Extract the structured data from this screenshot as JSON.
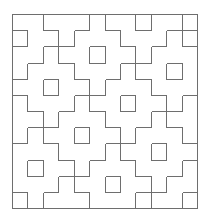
{
  "figure": {
    "grid": {
      "cols": 12,
      "rows": 12
    },
    "frame": {
      "x": 12,
      "y": 14,
      "cell_w": 15.42,
      "cell_h": 16.17
    },
    "tile": {
      "shape": "diamond",
      "radius": 2,
      "cells_per_tile": 13,
      "center_hole": true
    },
    "lattice": {
      "origin": [
        0,
        1
      ],
      "v1": [
        5,
        1
      ],
      "v2": [
        2,
        3
      ]
    },
    "visible_hole_centers": [
      [
        0,
        1
      ],
      [
        5,
        2
      ],
      [
        10,
        3
      ],
      [
        8,
        0
      ],
      [
        2,
        4
      ],
      [
        7,
        5
      ],
      [
        4,
        7
      ],
      [
        9,
        8
      ],
      [
        1,
        9
      ],
      [
        6,
        10
      ],
      [
        11,
        11
      ]
    ],
    "colors": {
      "line": "#6e6e6e",
      "background": "#ffffff"
    }
  }
}
